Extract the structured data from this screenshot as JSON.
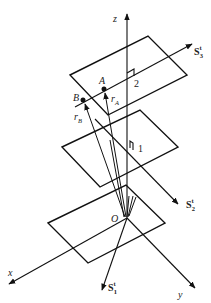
{
  "diagram": {
    "type": "3d-coordinate-diagram",
    "axes": {
      "x": {
        "label": "x"
      },
      "y": {
        "label": "y"
      },
      "z": {
        "label": "z"
      },
      "origin": {
        "label": "O"
      }
    },
    "planes": [
      {
        "id": "plane-bottom",
        "label": ""
      },
      {
        "id": "plane-1",
        "label": "1"
      },
      {
        "id": "plane-2",
        "label": "2"
      }
    ],
    "points": [
      {
        "id": "A",
        "label": "A"
      },
      {
        "id": "B",
        "label": "B"
      }
    ],
    "position_vectors": [
      {
        "id": "rA",
        "base": "r",
        "sub": "A"
      },
      {
        "id": "rB",
        "base": "r",
        "sub": "B"
      }
    ],
    "screw_axes": [
      {
        "id": "S1",
        "base": "S",
        "sub": "1",
        "sup": "t"
      },
      {
        "id": "S2",
        "base": "S",
        "sub": "2",
        "sup": "t"
      },
      {
        "id": "S3",
        "base": "S",
        "sub": "3",
        "sup": "t"
      }
    ],
    "colors": {
      "line": "#111111",
      "background": "#ffffff"
    }
  }
}
